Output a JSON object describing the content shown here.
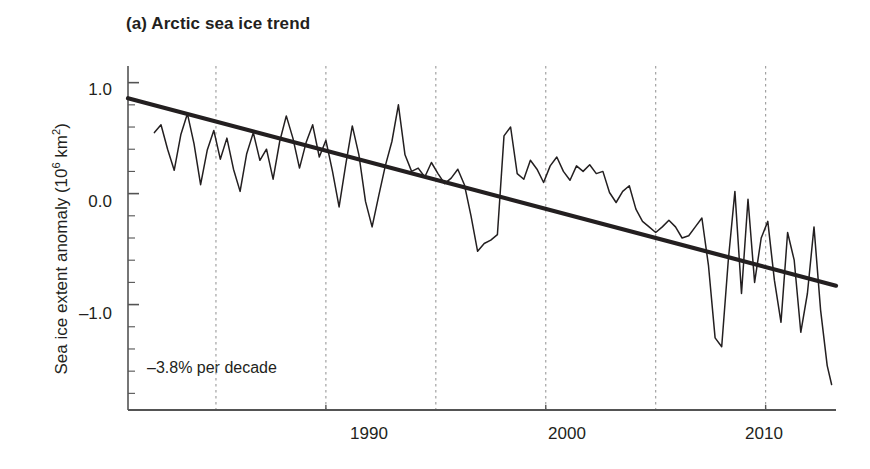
{
  "figure": {
    "panel_label": "(a)",
    "title": "(a) Arctic sea ice trend",
    "annotation": "–3.8% per decade"
  },
  "axes": {
    "y_title_main": "Sea ice extent anomaly (10",
    "y_title_sup": "6",
    "y_title_tail": " km",
    "y_title_sup2": "2",
    "y_title_close": ")",
    "y_ticks": [
      "1.0",
      "0.0",
      "–1.0"
    ],
    "x_ticks": [
      "1990",
      "2000",
      "2010"
    ]
  },
  "colors": {
    "line": "#231f20",
    "trend": "#231f20",
    "grid": "#9a9a9a",
    "axis": "#545454",
    "background": "#ffffff"
  },
  "chart_data": {
    "type": "line",
    "title": "(a) Arctic sea ice trend",
    "xlabel": "",
    "ylabel": "Sea ice extent anomaly (10^6 km^2)",
    "xlim": [
      1981.0,
      2013.2
    ],
    "ylim": [
      -1.95,
      1.15
    ],
    "grid": true,
    "grid_x_values": [
      1985,
      1990,
      1995,
      2000,
      2005,
      2010
    ],
    "legend": "none",
    "annotations": [
      {
        "text": "–3.8% per decade",
        "x": 1982.0,
        "y": -1.45
      }
    ],
    "y_tick_values": [
      1.0,
      0.0,
      -1.0
    ],
    "y_minor_tick_step": 0.2,
    "x_tick_values": [
      1990,
      2000,
      2010
    ],
    "series": [
      {
        "name": "Trend line",
        "type": "line",
        "style": "thick",
        "x": [
          1981.0,
          2013.2
        ],
        "values": [
          0.86,
          -0.83
        ],
        "slope_per_decade_percent": -3.8
      },
      {
        "name": "Sea ice extent anomaly",
        "type": "line",
        "style": "thin",
        "x": [
          1982.2,
          1982.5,
          1982.8,
          1983.1,
          1983.4,
          1983.7,
          1984.0,
          1984.3,
          1984.6,
          1984.9,
          1985.2,
          1985.5,
          1985.8,
          1986.1,
          1986.4,
          1986.7,
          1987.0,
          1987.3,
          1987.6,
          1987.9,
          1988.2,
          1988.5,
          1988.8,
          1989.1,
          1989.4,
          1989.7,
          1990.0,
          1990.3,
          1990.6,
          1990.9,
          1991.2,
          1991.5,
          1991.8,
          1992.1,
          1992.4,
          1992.7,
          1993.0,
          1993.3,
          1993.6,
          1993.9,
          1994.2,
          1994.5,
          1994.8,
          1995.1,
          1995.4,
          1995.7,
          1996.0,
          1996.3,
          1996.6,
          1996.9,
          1997.2,
          1997.5,
          1997.8,
          1998.1,
          1998.4,
          1998.7,
          1999.0,
          1999.3,
          1999.6,
          1999.9,
          2000.2,
          2000.5,
          2000.8,
          2001.1,
          2001.4,
          2001.7,
          2002.0,
          2002.3,
          2002.6,
          2002.9,
          2003.2,
          2003.5,
          2003.8,
          2004.1,
          2004.4,
          2004.7,
          2005.0,
          2005.3,
          2005.6,
          2005.9,
          2006.2,
          2006.5,
          2006.8,
          2007.1,
          2007.4,
          2007.7,
          2008.0,
          2008.3,
          2008.6,
          2008.9,
          2009.2,
          2009.5,
          2009.8,
          2010.1,
          2010.4,
          2010.7,
          2011.0,
          2011.3,
          2011.6,
          2011.9,
          2012.2,
          2012.5,
          2012.8,
          2013.0
        ],
        "values": [
          0.55,
          0.62,
          0.4,
          0.21,
          0.53,
          0.72,
          0.45,
          0.08,
          0.39,
          0.57,
          0.31,
          0.5,
          0.22,
          0.02,
          0.36,
          0.55,
          0.3,
          0.4,
          0.13,
          0.47,
          0.7,
          0.5,
          0.23,
          0.46,
          0.62,
          0.33,
          0.48,
          0.2,
          -0.12,
          0.26,
          0.61,
          0.35,
          -0.07,
          -0.3,
          -0.02,
          0.25,
          0.47,
          0.8,
          0.35,
          0.2,
          0.23,
          0.15,
          0.28,
          0.18,
          0.09,
          0.14,
          0.22,
          0.08,
          -0.2,
          -0.52,
          -0.45,
          -0.42,
          -0.37,
          0.52,
          0.6,
          0.18,
          0.13,
          0.3,
          0.22,
          0.1,
          0.25,
          0.33,
          0.2,
          0.12,
          0.25,
          0.2,
          0.26,
          0.18,
          0.2,
          0.01,
          -0.08,
          0.02,
          0.07,
          -0.14,
          -0.25,
          -0.3,
          -0.35,
          -0.3,
          -0.24,
          -0.3,
          -0.4,
          -0.38,
          -0.3,
          -0.22,
          -0.65,
          -1.3,
          -1.38,
          -0.6,
          0.02,
          -0.9,
          -0.05,
          -0.8,
          -0.4,
          -0.25,
          -0.78,
          -1.16,
          -0.35,
          -0.6,
          -1.25,
          -0.9,
          -0.3,
          -1.05,
          -1.55,
          -1.72
        ]
      }
    ]
  }
}
